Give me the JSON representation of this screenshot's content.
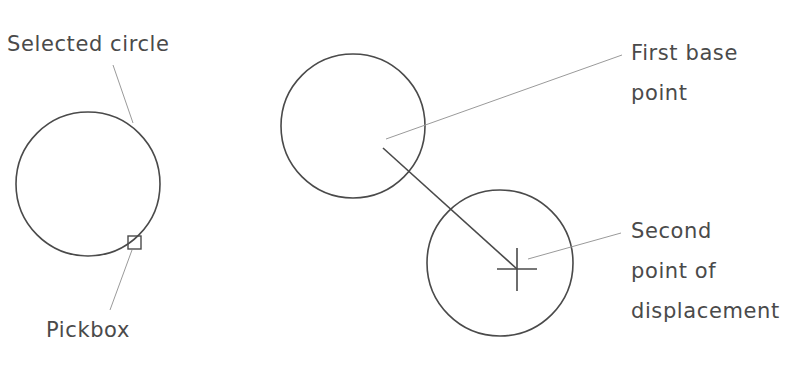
{
  "labels": {
    "selected_circle": "Selected circle",
    "pickbox": "Pickbox",
    "first_base_point": [
      "First base",
      "point"
    ],
    "second_point": [
      "Second",
      "point of",
      "displacement"
    ]
  },
  "colors": {
    "stroke": "#4a4a4a",
    "leader": "#9a9a9a",
    "text": "#4a4a4a",
    "background": "#ffffff"
  },
  "shapes": {
    "selected_circle": {
      "cx": 88,
      "cy": 184,
      "r": 72
    },
    "pickbox": {
      "x": 128,
      "y": 236,
      "size": 13
    },
    "original_circle": {
      "cx": 353,
      "cy": 126,
      "r": 72
    },
    "moved_circle": {
      "cx": 500,
      "cy": 263,
      "r": 73
    },
    "displacement_line": {
      "x1": 383,
      "y1": 148,
      "x2": 517,
      "y2": 269
    },
    "crosshair": {
      "cx": 517,
      "cy": 269,
      "h": 20,
      "v": 21
    }
  }
}
